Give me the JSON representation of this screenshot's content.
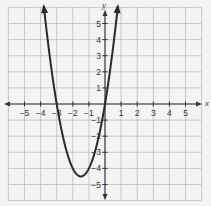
{
  "chart_data": {
    "type": "line",
    "title": "",
    "xlabel": "x",
    "ylabel": "y",
    "xlim": [
      -6,
      6
    ],
    "ylim": [
      -6,
      6
    ],
    "grid": true,
    "legend": "none",
    "x_ticks": [
      -5,
      -4,
      -3,
      -2,
      -1,
      1,
      2,
      3,
      4,
      5
    ],
    "y_ticks": [
      5,
      4,
      3,
      2,
      1,
      -1,
      -2,
      -3,
      -4,
      -5
    ],
    "x_tick_labels": [
      "−5",
      "−4",
      "−3",
      "−2",
      "−1",
      "1",
      "2",
      "3",
      "4",
      "5"
    ],
    "y_tick_labels": [
      "5",
      "4",
      "3",
      "2",
      "1",
      "−1",
      "−2",
      "−3",
      "−4",
      "−5"
    ],
    "series": [
      {
        "name": "parabola",
        "equation": "y = 2x^2 + 6x",
        "vertex": [
          -1.5,
          -4.5
        ],
        "x_intercepts": [
          -3,
          0
        ],
        "y_intercept": 0,
        "x": [
          -3.8,
          -3.5,
          -3,
          -2.5,
          -2,
          -1.5,
          -1,
          -0.5,
          0,
          0.5,
          0.8
        ],
        "values": [
          6.08,
          3.5,
          0,
          -2.5,
          -4,
          -4.5,
          -4,
          -2.5,
          0,
          3.5,
          6.08
        ],
        "arrows_at_ends": true
      }
    ]
  },
  "labels": {
    "x_axis": "x",
    "y_axis": "y"
  },
  "colors": {
    "grid": "#bdbdbd",
    "axis": "#333333",
    "curve": "#2a2a2a",
    "background": "#f4f4f4"
  }
}
